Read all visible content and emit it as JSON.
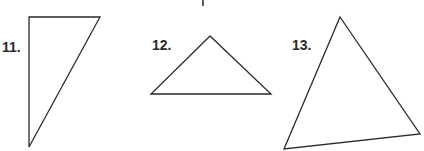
{
  "problems": [
    {
      "number": "11.",
      "label_pos": [
        2,
        40
      ],
      "vertices": [
        [
          29,
          17
        ],
        [
          100,
          17
        ],
        [
          29,
          147
        ]
      ]
    },
    {
      "number": "12.",
      "label_pos": [
        152,
        38
      ],
      "vertices": [
        [
          210,
          36
        ],
        [
          151,
          94
        ],
        [
          271,
          94
        ]
      ]
    },
    {
      "number": "13.",
      "label_pos": [
        292,
        38
      ],
      "vertices": [
        [
          340,
          17
        ],
        [
          284,
          149
        ],
        [
          420,
          134
        ]
      ]
    }
  ],
  "stroke_color": "#2a2a2a"
}
